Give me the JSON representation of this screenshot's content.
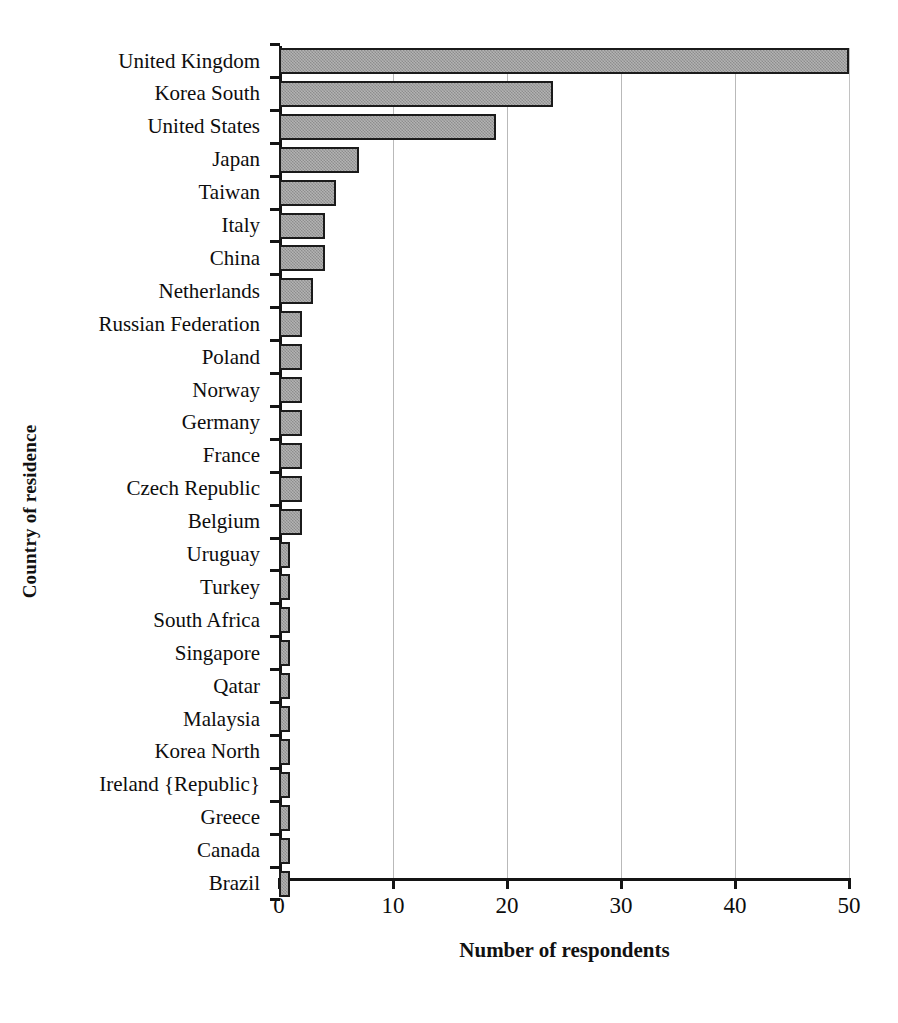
{
  "chart_data": {
    "type": "bar",
    "orientation": "horizontal",
    "title": "",
    "xlabel": "Number of respondents",
    "ylabel": "Country of residence",
    "xlim": [
      0,
      50
    ],
    "ylim": null,
    "grid": "vertical",
    "legend": "none",
    "xticks": [
      "0",
      "10",
      "20",
      "30",
      "40",
      "50"
    ],
    "xtick_values": [
      0,
      10,
      20,
      30,
      40,
      50
    ],
    "categories": [
      "United Kingdom",
      "Korea South",
      "United States",
      "Japan",
      "Taiwan",
      "Italy",
      "China",
      "Netherlands",
      "Russian Federation",
      "Poland",
      "Norway",
      "Germany",
      "France",
      "Czech Republic",
      "Belgium",
      "Uruguay",
      "Turkey",
      "South Africa",
      "Singapore",
      "Qatar",
      "Malaysia",
      "Korea North",
      "Ireland {Republic}",
      "Greece",
      "Canada",
      "Brazil"
    ],
    "values": [
      50,
      24,
      19,
      7,
      5,
      4,
      4,
      3,
      2,
      2,
      2,
      2,
      2,
      2,
      2,
      1,
      1,
      1,
      1,
      1,
      1,
      1,
      1,
      1,
      1,
      1
    ],
    "colors": {
      "bar_fill": "#9d9d9d",
      "bar_border": "#1b1b1b",
      "gridline": "#b9b9b9",
      "axis": "#141414",
      "text": "#0d0d0d",
      "background": "#ffffff"
    }
  }
}
